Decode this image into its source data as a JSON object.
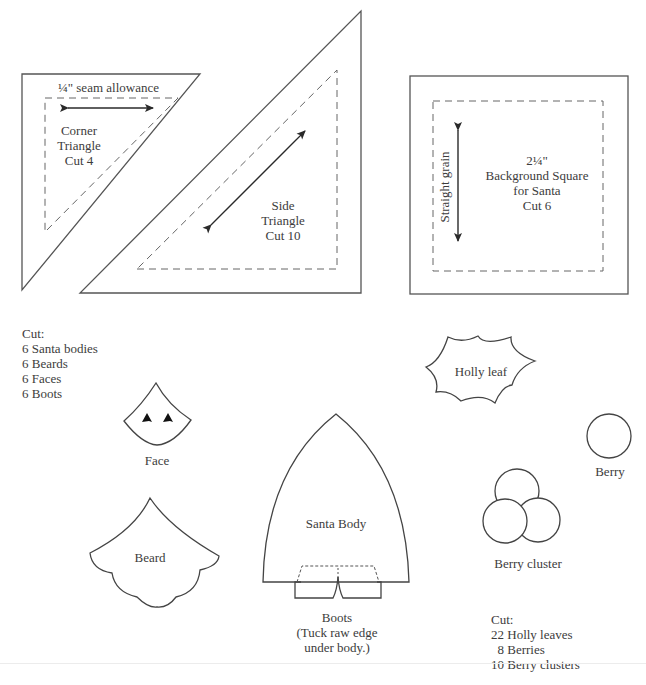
{
  "page": {
    "header_fragment": "...p...pg..."
  },
  "templates": {
    "corner_triangle": {
      "seam_label": "¼\" seam allowance",
      "name_lines": [
        "Corner",
        "Triangle",
        "Cut 4"
      ]
    },
    "side_triangle": {
      "name_lines": [
        "Side",
        "Triangle",
        "Cut 10"
      ]
    },
    "background_square": {
      "grain_label": "Straight grain",
      "name_lines": [
        "2¼\"",
        "Background Square",
        "for Santa",
        "Cut 6"
      ]
    },
    "santa_cut_list": {
      "heading": "Cut:",
      "items": [
        "6 Santa bodies",
        "6 Beards",
        "6 Faces",
        "6 Boots"
      ]
    },
    "face": {
      "label": "Face"
    },
    "beard": {
      "label": "Beard"
    },
    "santa_body": {
      "label": "Santa Body"
    },
    "boots": {
      "label_lines": [
        "Boots",
        "(Tuck raw edge",
        "under body.)"
      ]
    },
    "holly_leaf": {
      "label": "Holly leaf"
    },
    "berry": {
      "label": "Berry"
    },
    "berry_cluster": {
      "label": "Berry cluster"
    },
    "holly_cut_list": {
      "heading": "Cut:",
      "items": [
        "22 Holly leaves",
        "  8 Berries",
        "10 Berry clusters"
      ]
    }
  },
  "colors": {
    "line": "#444444",
    "text": "#3c3c3c",
    "background": "#ffffff"
  }
}
